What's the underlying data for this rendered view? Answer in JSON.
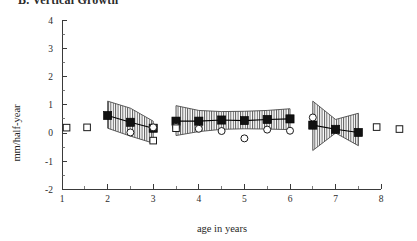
{
  "figure": {
    "title": "B. Vertical Growth",
    "title_clipped": true
  },
  "axes": {
    "y_label": "mm/half-year",
    "x_label": "age in years",
    "y_ticks": [
      "4",
      "3",
      "2",
      "1",
      "0",
      "-1",
      "-2"
    ],
    "x_ticks": [
      "1",
      "2",
      "3",
      "4",
      "5",
      "6",
      "7",
      "8"
    ]
  },
  "chart_data": {
    "type": "line",
    "title": "B. Vertical Growth",
    "xlabel": "age in years",
    "ylabel": "mm/half-year",
    "xlim": [
      1,
      8
    ],
    "ylim": [
      -2,
      4
    ],
    "y_ticks": [
      -2,
      -1,
      0,
      1,
      2,
      3,
      4
    ],
    "x_ticks": [
      1,
      2,
      3,
      4,
      5,
      6,
      7,
      8
    ],
    "y_minor_tick_step": 0.5,
    "x_minor_tick_step": 0.5,
    "grid": false,
    "legend": "none",
    "series": [
      {
        "name": "mean (filled square)",
        "marker": "filled-square",
        "points": [
          {
            "x": 2.0,
            "y": 0.62
          },
          {
            "x": 2.5,
            "y": 0.38
          },
          {
            "x": 3.0,
            "y": 0.17
          },
          {
            "x": 3.5,
            "y": 0.42
          },
          {
            "x": 4.0,
            "y": 0.42
          },
          {
            "x": 4.5,
            "y": 0.46
          },
          {
            "x": 5.0,
            "y": 0.44
          },
          {
            "x": 5.5,
            "y": 0.48
          },
          {
            "x": 6.0,
            "y": 0.5
          },
          {
            "x": 6.5,
            "y": 0.28
          },
          {
            "x": 7.0,
            "y": 0.13
          },
          {
            "x": 7.5,
            "y": 0.02
          }
        ]
      },
      {
        "name": "individual (open circle)",
        "marker": "open-circle",
        "points": [
          {
            "x": 2.5,
            "y": 0.02
          },
          {
            "x": 3.0,
            "y": 0.2
          },
          {
            "x": 3.5,
            "y": 0.22
          },
          {
            "x": 4.0,
            "y": 0.15
          },
          {
            "x": 4.5,
            "y": 0.07
          },
          {
            "x": 5.0,
            "y": -0.19
          },
          {
            "x": 5.5,
            "y": 0.12
          },
          {
            "x": 6.0,
            "y": 0.08
          },
          {
            "x": 6.5,
            "y": 0.55
          }
        ]
      },
      {
        "name": "isolated (open square)",
        "marker": "open-square",
        "points": [
          {
            "x": 1.1,
            "y": 0.19
          },
          {
            "x": 1.55,
            "y": 0.2
          },
          {
            "x": 3.5,
            "y": 0.17
          },
          {
            "x": 3.0,
            "y": -0.27
          },
          {
            "x": 7.9,
            "y": 0.21
          },
          {
            "x": 8.4,
            "y": 0.14
          }
        ]
      }
    ],
    "bands": [
      {
        "name": "band-1",
        "x_start": 2.0,
        "x_end": 3.0,
        "upper": [
          1.13,
          0.88,
          0.42
        ],
        "lower": [
          0.17,
          -0.11,
          -0.36
        ],
        "hatch": "vertical-lines"
      },
      {
        "name": "band-2",
        "x_start": 3.5,
        "x_end": 6.0,
        "upper": [
          0.97,
          0.8,
          0.76,
          0.77,
          0.8,
          0.86
        ],
        "lower": [
          -0.09,
          0.05,
          0.13,
          0.15,
          0.14,
          0.12
        ],
        "hatch": "vertical-lines"
      },
      {
        "name": "band-3",
        "x_start": 6.5,
        "x_end": 7.5,
        "upper": [
          1.13,
          0.48,
          0.7
        ],
        "lower": [
          -0.62,
          0.0,
          -0.45
        ],
        "hatch": "vertical-lines"
      }
    ]
  }
}
